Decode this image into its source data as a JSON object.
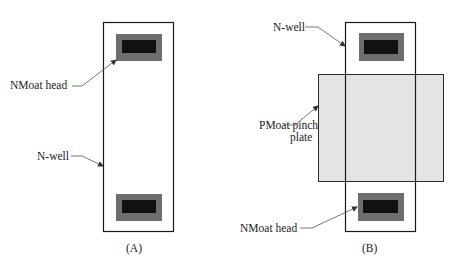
{
  "figure": {
    "panels": [
      {
        "id": "A",
        "caption": "(A)",
        "labels": {
          "nmoat_head": "NMoat head",
          "n_well": "N-well"
        }
      },
      {
        "id": "B",
        "caption": "(B)",
        "labels": {
          "n_well": "N-well",
          "pmoat_line1": "PMoat pinch",
          "pmoat_line2": "plate",
          "nmoat_head": "NMoat head"
        }
      }
    ],
    "colors": {
      "outline": "#1a1a1a",
      "head_outer": "#6e6e6e",
      "head_inner": "#111111",
      "pinch_plate": "#e4e4e4",
      "leader": "#555555"
    }
  }
}
